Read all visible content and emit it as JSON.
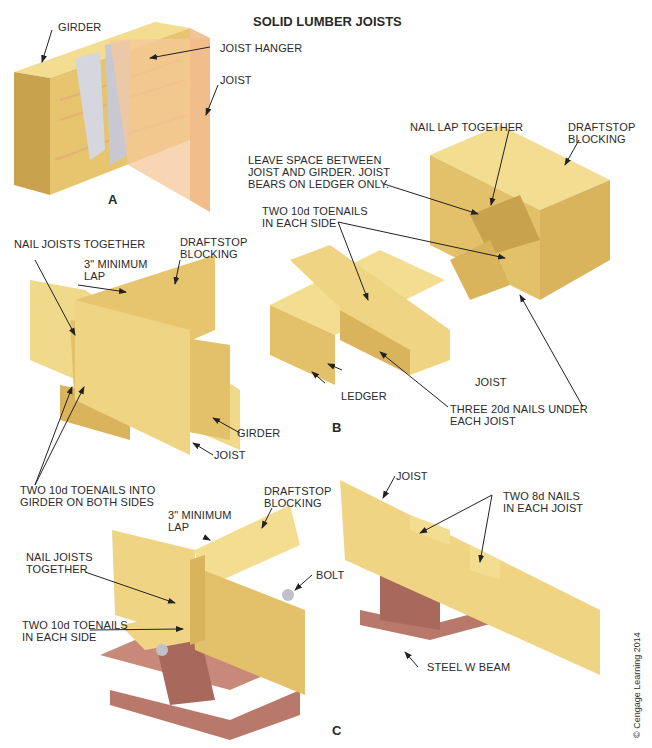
{
  "title": "SOLID LUMBER JOISTS",
  "sections": {
    "a": "A",
    "b": "B",
    "c": "C"
  },
  "colors": {
    "wood_light": "#f0d98a",
    "wood_mid": "#e3c06a",
    "wood_dark": "#c9a24e",
    "wood_grain": "#e2a07a",
    "steel": "#c9897a",
    "steel_dark": "#a8685c",
    "hanger": "#d8d8df",
    "joist_transparent": "#f5c89a"
  },
  "labels": {
    "a_girder": "GIRDER",
    "a_joist_hanger": "JOIST HANGER",
    "a_joist": "JOIST",
    "b_nail_lap": "NAIL LAP TOGETHER",
    "b_draftstop_right": "DRAFTSTOP\nBLOCKING",
    "b_leave_space": "LEAVE SPACE BETWEEN\nJOIST AND GIRDER. JOIST\nBEARS ON LEDGER ONLY.",
    "b_two_10d": "TWO 10d TOENAILS\nIN EACH SIDE",
    "b_joist": "JOIST",
    "b_ledger": "LEDGER",
    "b_three_20d": "THREE 20d NAILS UNDER\nEACH JOIST",
    "l_nail_joists": "NAIL JOISTS TOGETHER",
    "l_min_lap": "3\" MINIMUM\nLAP",
    "l_draftstop": "DRAFTSTOP\nBLOCKING",
    "l_girder": "GIRDER",
    "l_joist": "JOIST",
    "l_two_10d": "TWO 10d TOENAILS INTO\nGIRDER ON BOTH SIDES",
    "c_draftstop": "DRAFTSTOP\nBLOCKING",
    "c_min_lap": "3\" MINIMUM\nLAP",
    "c_nail_joists": "NAIL JOISTS\nTOGETHER",
    "c_bolt": "BOLT",
    "c_two_10d": "TWO 10d TOENAILS\nIN EACH SIDE",
    "c_joist": "JOIST",
    "c_two_8d": "TWO 8d NAILS\nIN EACH JOIST",
    "c_steel_beam": "STEEL W BEAM"
  },
  "credit": "© Cengage Learning 2014"
}
